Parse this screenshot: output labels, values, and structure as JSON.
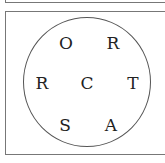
{
  "puzzle": {
    "letters": [
      {
        "char": "O",
        "x": 66,
        "y": 43
      },
      {
        "char": "R",
        "x": 113,
        "y": 43
      },
      {
        "char": "R",
        "x": 42,
        "y": 83
      },
      {
        "char": "C",
        "x": 87,
        "y": 83
      },
      {
        "char": "T",
        "x": 133,
        "y": 83
      },
      {
        "char": "S",
        "x": 65,
        "y": 125
      },
      {
        "char": "A",
        "x": 111,
        "y": 125
      }
    ]
  }
}
